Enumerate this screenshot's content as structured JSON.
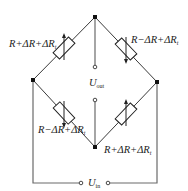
{
  "diagram": {
    "type": "wheatstone-bridge",
    "nodes": {
      "top": [
        95,
        17
      ],
      "left": [
        33,
        80
      ],
      "right": [
        157,
        82
      ],
      "bottom": [
        95,
        147
      ]
    },
    "resistors": [
      {
        "id": "r1",
        "position": "top-left",
        "label": "R+ΔR+ΔR",
        "label_sub": "t",
        "center": [
          64,
          48
        ],
        "arrow": "up"
      },
      {
        "id": "r2",
        "position": "top-right",
        "label": "R−ΔR+ΔR",
        "label_sub": "t",
        "center": [
          126,
          49
        ],
        "arrow": "down"
      },
      {
        "id": "r3",
        "position": "bottom-left",
        "label": "R−ΔR+ΔR",
        "label_sub": "t",
        "center": [
          64,
          113
        ],
        "arrow": "down"
      },
      {
        "id": "r4",
        "position": "bottom-right",
        "label": "R+ΔR+ΔR",
        "label_sub": "t",
        "center": [
          126,
          114
        ],
        "arrow": "up"
      }
    ],
    "output": {
      "symbol": "U",
      "sub": "out",
      "terminal_top_y": 67,
      "terminal_bottom_y": 100
    },
    "input": {
      "symbol": "U",
      "sub": "in",
      "terminal_left_x": 81,
      "terminal_right_x": 108,
      "y": 183
    },
    "colors": {
      "line": "#3a3a3a",
      "text": "#222222",
      "background": "#ffffff"
    }
  }
}
